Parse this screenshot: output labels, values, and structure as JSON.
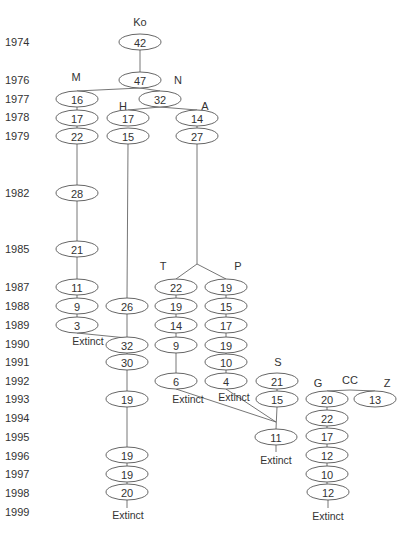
{
  "years": [
    {
      "label": "1974",
      "y": 42
    },
    {
      "label": "1976",
      "y": 80
    },
    {
      "label": "1977",
      "y": 99
    },
    {
      "label": "1978",
      "y": 117
    },
    {
      "label": "1979",
      "y": 136
    },
    {
      "label": "1982",
      "y": 193
    },
    {
      "label": "1985",
      "y": 249
    },
    {
      "label": "1987",
      "y": 287
    },
    {
      "label": "1988",
      "y": 306
    },
    {
      "label": "1989",
      "y": 325
    },
    {
      "label": "1990",
      "y": 344
    },
    {
      "label": "1991",
      "y": 362
    },
    {
      "label": "1992",
      "y": 381
    },
    {
      "label": "1993",
      "y": 399
    },
    {
      "label": "1994",
      "y": 418
    },
    {
      "label": "1995",
      "y": 437
    },
    {
      "label": "1996",
      "y": 456
    },
    {
      "label": "1997",
      "y": 474
    },
    {
      "label": "1998",
      "y": 493
    },
    {
      "label": "1999",
      "y": 512
    }
  ],
  "groups": [
    {
      "label": "Ko",
      "x": 140,
      "y": 26
    },
    {
      "label": "M",
      "x": 76,
      "y": 81
    },
    {
      "label": "N",
      "x": 178,
      "y": 84
    },
    {
      "label": "H",
      "x": 123,
      "y": 110
    },
    {
      "label": "A",
      "x": 205,
      "y": 110
    },
    {
      "label": "T",
      "x": 163,
      "y": 270
    },
    {
      "label": "P",
      "x": 238,
      "y": 270
    },
    {
      "label": "S",
      "x": 278,
      "y": 366
    },
    {
      "label": "CC",
      "x": 350,
      "y": 384
    },
    {
      "label": "G",
      "x": 318,
      "y": 387
    },
    {
      "label": "Z",
      "x": 387,
      "y": 387
    }
  ],
  "nodes": [
    {
      "id": "ko74",
      "lineage": "Ko",
      "year": "1974",
      "value": "42",
      "x": 140,
      "y": 42
    },
    {
      "id": "ko76",
      "lineage": "Ko",
      "year": "1976",
      "value": "47",
      "x": 140,
      "y": 80
    },
    {
      "id": "n77",
      "lineage": "N",
      "year": "1977",
      "value": "32",
      "x": 160,
      "y": 99
    },
    {
      "id": "m77",
      "lineage": "M",
      "year": "1977",
      "value": "16",
      "x": 77,
      "y": 99
    },
    {
      "id": "m78",
      "lineage": "M",
      "year": "1978",
      "value": "17",
      "x": 77,
      "y": 118
    },
    {
      "id": "m79",
      "lineage": "M",
      "year": "1979",
      "value": "22",
      "x": 77,
      "y": 136
    },
    {
      "id": "m82",
      "lineage": "M",
      "year": "1982",
      "value": "28",
      "x": 77,
      "y": 193
    },
    {
      "id": "m85",
      "lineage": "M",
      "year": "1985",
      "value": "21",
      "x": 77,
      "y": 249
    },
    {
      "id": "m87",
      "lineage": "M",
      "year": "1987",
      "value": "11",
      "x": 77,
      "y": 287
    },
    {
      "id": "m88",
      "lineage": "M",
      "year": "1988",
      "value": "9",
      "x": 77,
      "y": 306
    },
    {
      "id": "m89",
      "lineage": "M",
      "year": "1989",
      "value": "3",
      "x": 77,
      "y": 325
    },
    {
      "id": "h78",
      "lineage": "H",
      "year": "1978",
      "value": "17",
      "x": 128,
      "y": 118
    },
    {
      "id": "h79",
      "lineage": "H",
      "year": "1979",
      "value": "15",
      "x": 128,
      "y": 136
    },
    {
      "id": "h88",
      "lineage": "H",
      "year": "1988",
      "value": "26",
      "x": 127,
      "y": 306
    },
    {
      "id": "h90",
      "lineage": "H",
      "year": "1990",
      "value": "32",
      "x": 127,
      "y": 345
    },
    {
      "id": "h91",
      "lineage": "H",
      "year": "1991",
      "value": "30",
      "x": 127,
      "y": 362
    },
    {
      "id": "h93",
      "lineage": "H",
      "year": "1993",
      "value": "19",
      "x": 127,
      "y": 399
    },
    {
      "id": "h96",
      "lineage": "H",
      "year": "1996",
      "value": "19",
      "x": 127,
      "y": 455
    },
    {
      "id": "h97",
      "lineage": "H",
      "year": "1997",
      "value": "19",
      "x": 127,
      "y": 474
    },
    {
      "id": "h98",
      "lineage": "H",
      "year": "1998",
      "value": "20",
      "x": 127,
      "y": 492
    },
    {
      "id": "a78",
      "lineage": "A",
      "year": "1978",
      "value": "14",
      "x": 197,
      "y": 118
    },
    {
      "id": "a79",
      "lineage": "A",
      "year": "1979",
      "value": "27",
      "x": 197,
      "y": 136
    },
    {
      "id": "t87",
      "lineage": "T",
      "year": "1987",
      "value": "22",
      "x": 176,
      "y": 287
    },
    {
      "id": "t88",
      "lineage": "T",
      "year": "1988",
      "value": "19",
      "x": 176,
      "y": 306
    },
    {
      "id": "t89",
      "lineage": "T",
      "year": "1989",
      "value": "14",
      "x": 176,
      "y": 325
    },
    {
      "id": "t90",
      "lineage": "T",
      "year": "1990",
      "value": "9",
      "x": 176,
      "y": 345
    },
    {
      "id": "t92",
      "lineage": "T",
      "year": "1992",
      "value": "6",
      "x": 176,
      "y": 381
    },
    {
      "id": "p87",
      "lineage": "P",
      "year": "1987",
      "value": "19",
      "x": 226,
      "y": 287
    },
    {
      "id": "p88",
      "lineage": "P",
      "year": "1988",
      "value": "15",
      "x": 226,
      "y": 306
    },
    {
      "id": "p89",
      "lineage": "P",
      "year": "1989",
      "value": "17",
      "x": 226,
      "y": 325
    },
    {
      "id": "p90",
      "lineage": "P",
      "year": "1990",
      "value": "19",
      "x": 226,
      "y": 345
    },
    {
      "id": "p91",
      "lineage": "P",
      "year": "1991",
      "value": "10",
      "x": 226,
      "y": 362
    },
    {
      "id": "p92",
      "lineage": "P",
      "year": "1992",
      "value": "4",
      "x": 226,
      "y": 381
    },
    {
      "id": "s92",
      "lineage": "S",
      "year": "1992",
      "value": "21",
      "x": 277,
      "y": 381
    },
    {
      "id": "s93",
      "lineage": "S",
      "year": "1993",
      "value": "15",
      "x": 277,
      "y": 399
    },
    {
      "id": "s95",
      "lineage": "S",
      "year": "1995",
      "value": "11",
      "x": 276,
      "y": 437
    },
    {
      "id": "g93",
      "lineage": "G",
      "year": "1993",
      "value": "20",
      "x": 327,
      "y": 399
    },
    {
      "id": "g94",
      "lineage": "G",
      "year": "1994",
      "value": "22",
      "x": 327,
      "y": 418
    },
    {
      "id": "g95",
      "lineage": "G",
      "year": "1995",
      "value": "17",
      "x": 327,
      "y": 436
    },
    {
      "id": "g96",
      "lineage": "G",
      "year": "1996",
      "value": "12",
      "x": 327,
      "y": 455
    },
    {
      "id": "g97",
      "lineage": "G",
      "year": "1997",
      "value": "10",
      "x": 327,
      "y": 474
    },
    {
      "id": "g98",
      "lineage": "G",
      "year": "1998",
      "value": "12",
      "x": 328,
      "y": 492
    },
    {
      "id": "z93",
      "lineage": "Z",
      "year": "1993",
      "value": "13",
      "x": 375,
      "y": 399
    }
  ],
  "extinct_labels": [
    {
      "text": "Extinct",
      "lineage": "M",
      "x": 88,
      "y": 345
    },
    {
      "text": "Extinct",
      "lineage": "T",
      "x": 188,
      "y": 403
    },
    {
      "text": "Extinct",
      "lineage": "P",
      "x": 234,
      "y": 401
    },
    {
      "text": "Extinct",
      "lineage": "S",
      "x": 276,
      "y": 464
    },
    {
      "text": "Extinct",
      "lineage": "H",
      "x": 128,
      "y": 519
    },
    {
      "text": "Extinct",
      "lineage": "G",
      "x": 328,
      "y": 520
    }
  ],
  "edges": [
    [
      140,
      50,
      140,
      72
    ],
    [
      140,
      88,
      77,
      91
    ],
    [
      140,
      88,
      160,
      91
    ],
    [
      160,
      107,
      128,
      110
    ],
    [
      160,
      107,
      197,
      110
    ],
    [
      77,
      107,
      77,
      110
    ],
    [
      77,
      126,
      77,
      128
    ],
    [
      77,
      144,
      77,
      185
    ],
    [
      77,
      201,
      77,
      241
    ],
    [
      77,
      257,
      77,
      279
    ],
    [
      77,
      295,
      77,
      298
    ],
    [
      77,
      314,
      77,
      317
    ],
    [
      77,
      333,
      127,
      338
    ],
    [
      128,
      144,
      127,
      298
    ],
    [
      127,
      314,
      127,
      337
    ],
    [
      127,
      353,
      127,
      354
    ],
    [
      127,
      370,
      127,
      391
    ],
    [
      127,
      407,
      127,
      447
    ],
    [
      127,
      463,
      127,
      466
    ],
    [
      127,
      482,
      127,
      484
    ],
    [
      127,
      500,
      127,
      508
    ],
    [
      197,
      126,
      197,
      128
    ],
    [
      197,
      144,
      197,
      264
    ],
    [
      197,
      264,
      176,
      279
    ],
    [
      197,
      264,
      226,
      279
    ],
    [
      176,
      295,
      176,
      298
    ],
    [
      176,
      314,
      176,
      317
    ],
    [
      176,
      333,
      176,
      337
    ],
    [
      176,
      353,
      176,
      373
    ],
    [
      226,
      295,
      226,
      298
    ],
    [
      226,
      314,
      226,
      317
    ],
    [
      226,
      333,
      226,
      337
    ],
    [
      226,
      353,
      226,
      354
    ],
    [
      226,
      370,
      226,
      373
    ],
    [
      176,
      389,
      276,
      422
    ],
    [
      226,
      389,
      276,
      422
    ],
    [
      277,
      389,
      277,
      391
    ],
    [
      277,
      407,
      276,
      429
    ],
    [
      276,
      445,
      276,
      452
    ],
    [
      350,
      390,
      327,
      391
    ],
    [
      350,
      390,
      375,
      391
    ],
    [
      327,
      407,
      327,
      410
    ],
    [
      327,
      426,
      327,
      428
    ],
    [
      327,
      444,
      327,
      447
    ],
    [
      327,
      463,
      327,
      466
    ],
    [
      327,
      482,
      327,
      484
    ],
    [
      328,
      500,
      328,
      508
    ]
  ]
}
